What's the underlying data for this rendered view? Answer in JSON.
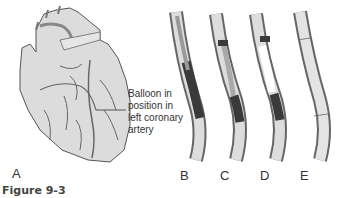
{
  "figure": {
    "caption": "Figure 9-3",
    "callout_lines": [
      "Balloon in",
      "position in",
      "left coronary",
      "artery"
    ],
    "panels": [
      {
        "label": "A",
        "content": "heart"
      },
      {
        "label": "B",
        "content": "balloon catheter in occluded artery"
      },
      {
        "label": "C",
        "content": "balloon advanced"
      },
      {
        "label": "D",
        "content": "balloon inflated"
      },
      {
        "label": "E",
        "content": "widened artery"
      }
    ]
  },
  "colors": {
    "tissue": "#dcdcdc",
    "outline": "#555555",
    "vessel": "#666666",
    "plaque": "#3a3a3a",
    "text": "#333333"
  }
}
